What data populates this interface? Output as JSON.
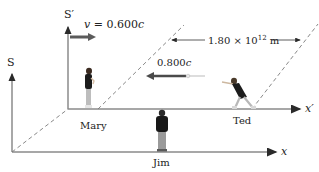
{
  "figure": {
    "frames": {
      "S": {
        "label": "S",
        "x_axis_label": "x"
      },
      "S_prime": {
        "label": "S′",
        "x_axis_label": "x′"
      }
    },
    "velocity": {
      "var": "v",
      "eq": " = 0.600",
      "unit": "c"
    },
    "light_pulse": {
      "value": "0.800",
      "unit": "c"
    },
    "distance": {
      "mantissa": "1.80 × 10",
      "exponent": "12",
      "unit": " m"
    },
    "observers": [
      {
        "name": "Mary",
        "frame": "S_prime"
      },
      {
        "name": "Ted",
        "frame": "S_prime"
      },
      {
        "name": "Jim",
        "frame": "S"
      }
    ],
    "colors": {
      "axis": "#6e6e6e",
      "arrow": "#5b5b5b",
      "dashed": "#7a7a7a",
      "text": "#222222"
    }
  }
}
